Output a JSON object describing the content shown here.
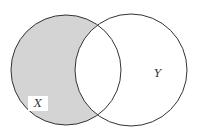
{
  "diagram": {
    "type": "venn",
    "sets": [
      {
        "name": "X",
        "label": "X",
        "cx": 66,
        "cy": 70,
        "r": 55
      },
      {
        "name": "Y",
        "label": "Y",
        "cx": 131,
        "cy": 70,
        "r": 56
      }
    ],
    "shaded_region": "X only (X minus Y)",
    "colors": {
      "shade": "#d4d4d4",
      "stroke": "#333333",
      "label_box": "#ffffff"
    }
  }
}
